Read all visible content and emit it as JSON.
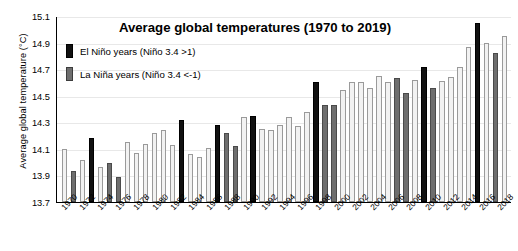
{
  "chart_data": {
    "type": "bar",
    "title": "Average global temperatures (1970 to 2019)",
    "xlabel": "",
    "ylabel": "Average global temperature (°C)",
    "ylim": [
      13.7,
      15.1
    ],
    "yticks": [
      "13.7",
      "13.9",
      "14.1",
      "14.3",
      "14.5",
      "14.7",
      "14.9",
      "15.1"
    ],
    "grid": true,
    "legend_position": "top-left",
    "legend": [
      {
        "key": "nino",
        "label": "El Niño years (Niño 3.4 >1)",
        "color": "#111111"
      },
      {
        "key": "nina",
        "label": "La Niña years (Niño 3.4 <-1)",
        "color": "#6e6e6e"
      }
    ],
    "categories": [
      "1970",
      "1971",
      "1972",
      "1973",
      "1974",
      "1975",
      "1976",
      "1977",
      "1978",
      "1979",
      "1980",
      "1981",
      "1982",
      "1983",
      "1984",
      "1985",
      "1986",
      "1987",
      "1988",
      "1989",
      "1990",
      "1991",
      "1992",
      "1993",
      "1994",
      "1995",
      "1996",
      "1997",
      "1998",
      "1999",
      "2000",
      "2001",
      "2002",
      "2003",
      "2004",
      "2005",
      "2006",
      "2007",
      "2008",
      "2009",
      "2010",
      "2011",
      "2012",
      "2013",
      "2014",
      "2015",
      "2016",
      "2017",
      "2018",
      "2019"
    ],
    "xtick_labels": [
      "1970",
      "1972",
      "1974",
      "1976",
      "1978",
      "1980",
      "1982",
      "1984",
      "1986",
      "1988",
      "1990",
      "1992",
      "1994",
      "1996",
      "1998",
      "2000",
      "2002",
      "2004",
      "2006",
      "2008",
      "2010",
      "2012",
      "2014",
      "2016",
      "2018"
    ],
    "values": [
      14.1,
      13.93,
      14.02,
      14.18,
      13.96,
      13.99,
      13.89,
      14.15,
      14.07,
      14.14,
      14.22,
      14.24,
      14.13,
      14.32,
      14.06,
      14.04,
      14.11,
      14.28,
      14.22,
      14.12,
      14.34,
      14.35,
      14.25,
      14.24,
      14.28,
      14.34,
      14.27,
      14.38,
      14.6,
      14.43,
      14.43,
      14.54,
      14.6,
      14.6,
      14.56,
      14.65,
      14.6,
      14.63,
      14.52,
      14.62,
      14.72,
      14.56,
      14.61,
      14.64,
      14.72,
      14.87,
      15.05,
      14.9,
      14.82,
      14.95
    ],
    "series_class": [
      "neutral",
      "nina",
      "neutral",
      "nino",
      "neutral",
      "nina",
      "nina",
      "neutral",
      "neutral",
      "neutral",
      "neutral",
      "neutral",
      "neutral",
      "nino",
      "neutral",
      "neutral",
      "neutral",
      "nino",
      "nina",
      "nina",
      "neutral",
      "nino",
      "neutral",
      "neutral",
      "neutral",
      "neutral",
      "neutral",
      "neutral",
      "nino",
      "nina",
      "nina",
      "neutral",
      "neutral",
      "neutral",
      "neutral",
      "neutral",
      "neutral",
      "nina",
      "nina",
      "neutral",
      "nino",
      "nina",
      "neutral",
      "neutral",
      "neutral",
      "neutral",
      "nino",
      "neutral",
      "nina",
      "neutral"
    ]
  }
}
